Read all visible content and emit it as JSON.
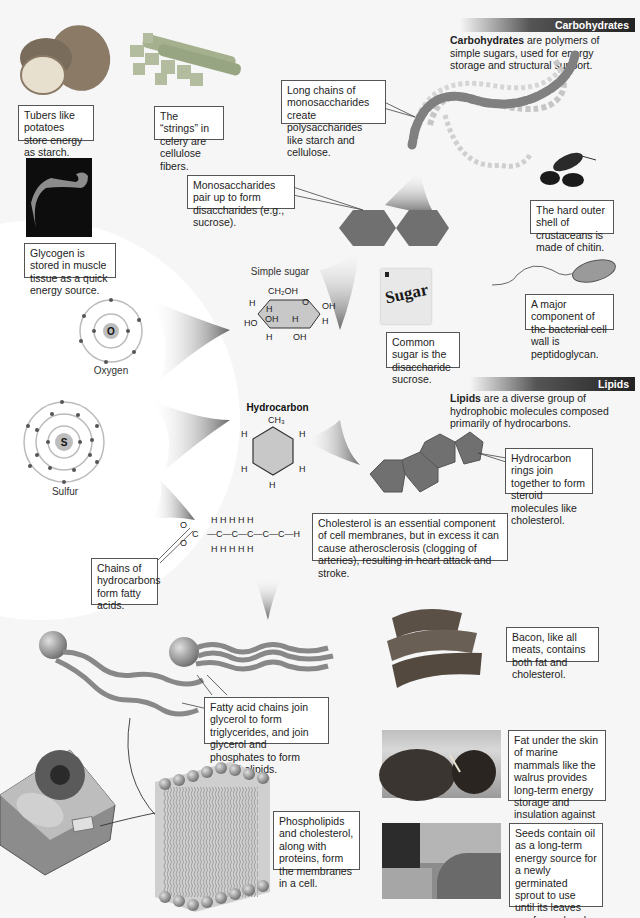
{
  "sections": {
    "carbohydrates": {
      "header": "Carbohydrates",
      "intro_bold": "Carbohydrates",
      "intro_rest": " are polymers of simple sugars, used for energy storage and structural support."
    },
    "lipids": {
      "header": "Lipids",
      "intro_bold": "Lipids",
      "intro_rest": " are a diverse group of hydrophobic molecules composed primarily of hydrocarbons."
    }
  },
  "captions": {
    "tubers": "Tubers like potatoes store energy as starch.",
    "celery": "The “strings” in celery are cellulose fibers.",
    "polysaccharides": "Long chains of monosaccharides create polysaccharides like starch and cellulose.",
    "chitin": "The hard outer shell of crustaceans is made of chitin.",
    "glycogen": "Glycogen is stored in muscle tissue as a quick energy source.",
    "disaccharides": "Monosaccharides pair up to form disaccharides (e.g., sucrose).",
    "peptidoglycan": "A major component of the bacterial cell wall is peptidoglycan.",
    "sucrose": "Common sugar is the disaccharide sucrose.",
    "steroid": "Hydrocarbon rings join together to form steroid molecules like cholesterol.",
    "cholesterol": "Cholesterol is an essential component of cell membranes, but in excess it can cause atherosclerosis (clogging of arteries), resulting in heart attack and stroke.",
    "fatty_acids": "Chains of hydrocarbons form fatty acids.",
    "bacon": "Bacon, like all meats, contains both fat and cholesterol.",
    "triglycerides": "Fatty acid chains join glycerol to form triglycerides, and join glycerol and phosphates to form phospholipids.",
    "walrus": "Fat under the skin of marine mammals like the walrus provides long-term energy storage and insulation against icy waters.",
    "membranes": "Phospholipids and cholesterol, along with proteins, form the membranes in a cell.",
    "seeds": "Seeds contain oil as a long-term energy source for a newly germinated sprout to use until its leaves are formed and capable of photosynthesis."
  },
  "molecules": {
    "simple_sugar_title": "Simple sugar",
    "hydrocarbon_title": "Hydrocarbon",
    "sugar_packet_text": "Sugar",
    "glucose": {
      "ch2oh": "CH₂OH",
      "o": "O",
      "oh": "OH",
      "h": "H",
      "ho": "HO"
    },
    "toluene": {
      "ch3": "CH₃",
      "h": "H"
    },
    "fatty_acid_chain": {
      "o": "O",
      "c": "C",
      "h": "H"
    }
  },
  "atoms": {
    "oxygen": {
      "symbol": "O",
      "label": "Oxygen"
    },
    "sulfur": {
      "symbol": "S",
      "label": "Sulfur"
    }
  },
  "colors": {
    "header_dark": "#222222",
    "molecule_fill": "#707070",
    "caption_border": "#555555",
    "background": "#f6f6f6"
  }
}
